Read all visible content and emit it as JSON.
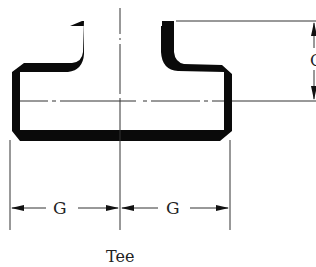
{
  "diagram": {
    "title": "Tee",
    "dimensions": {
      "center_to_end_run_left": "G",
      "center_to_end_run_right": "G",
      "center_to_end_outlet": "C"
    },
    "colors": {
      "wall": "#0a0a0a",
      "line": "#333333",
      "background": "#ffffff"
    }
  }
}
